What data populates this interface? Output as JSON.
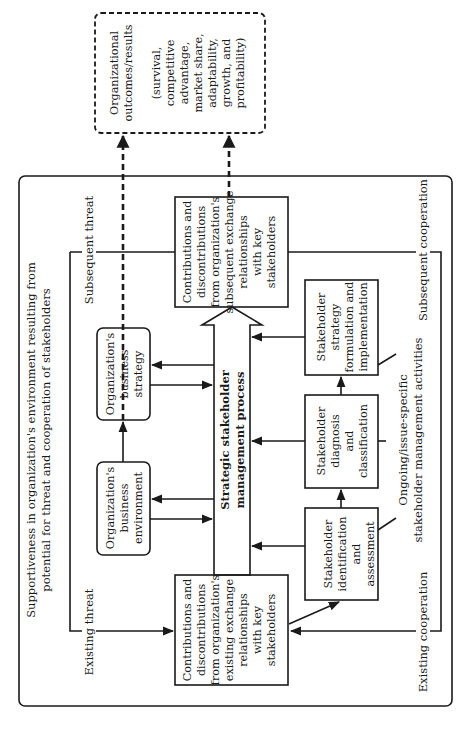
{
  "diagram": {
    "title_line1": "Supportiveness in organization's environment resulting from",
    "title_line2": "potential for threat and cooperation of stakeholders",
    "outcomes": {
      "line1": "Organizational",
      "line2": "outcomes/results",
      "detail": [
        "(survival,",
        "competitive",
        "advantage,",
        "market share,",
        "adaptability,",
        "growth, and",
        "profitability)"
      ]
    },
    "subsequent_contributions": [
      "Contributions and",
      "discontributions",
      "from organization's",
      "subsequent exchange",
      "relationships",
      "with key",
      "stakeholders"
    ],
    "existing_contributions": [
      "Contributions and",
      "discontributions",
      "from organization's",
      "existing exchange",
      "relationships",
      "with key",
      "stakeholders"
    ],
    "business_strategy": [
      "Organization's",
      "business",
      "strategy"
    ],
    "business_environment": [
      "Organization's",
      "business",
      "environment"
    ],
    "process": [
      "Strategic stakeholder",
      "management process"
    ],
    "stakeholder_strategy": [
      "Stakeholder",
      "strategy",
      "formulation and",
      "implementation"
    ],
    "stakeholder_diagnosis": [
      "Stakeholder",
      "diagnosis",
      "and",
      "classification"
    ],
    "stakeholder_identification": [
      "Stakeholder",
      "identification",
      "and",
      "assessment"
    ],
    "ongoing": [
      "Ongoing/issue-specific",
      "stakeholder management activities"
    ],
    "labels": {
      "subsequent_threat": "Subsequent threat",
      "existing_threat": "Existing threat",
      "subsequent_cooperation": "Subsequent cooperation",
      "existing_cooperation": "Existing cooperation"
    }
  }
}
